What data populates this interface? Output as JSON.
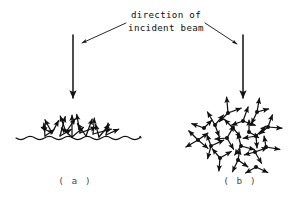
{
  "figure": {
    "background_color": "#ffffff",
    "ink_color": "#111111",
    "label_color": "#4a4a4a",
    "annotation": {
      "line1": "direction of",
      "line2": "incident beam"
    },
    "panels": [
      {
        "id": "a",
        "label": "( a )",
        "kind": "surface-scattering",
        "description": "rough wavy surface with arrows scattering upward"
      },
      {
        "id": "b",
        "label": "( b )",
        "kind": "volume-scattering",
        "description": "cloud of scattering centres with arrows radiating in all directions"
      }
    ],
    "incident_beams": [
      {
        "name": "beam-arrow-a",
        "x": 73,
        "y_top": 35,
        "y_bottom": 98
      },
      {
        "name": "beam-arrow-b",
        "x": 243,
        "y_top": 35,
        "y_bottom": 98
      }
    ],
    "leaders": [
      {
        "name": "leader-left",
        "x1": 126,
        "y1": 23,
        "x2": 82,
        "y2": 43
      },
      {
        "name": "leader-right",
        "x1": 205,
        "y1": 23,
        "x2": 237,
        "y2": 44
      }
    ],
    "wavy_surface": {
      "x_start": 16,
      "x_end": 141,
      "y_center": 138,
      "amplitude": 3.2,
      "wavelength": 9.5
    },
    "surface_rays": [
      {
        "x": 52,
        "y": 133,
        "angle": -118,
        "len": 15
      },
      {
        "x": 52,
        "y": 133,
        "angle": -62,
        "len": 14
      },
      {
        "x": 52,
        "y": 133,
        "angle": -152,
        "len": 12
      },
      {
        "x": 60,
        "y": 136,
        "angle": -75,
        "len": 20
      },
      {
        "x": 60,
        "y": 136,
        "angle": -30,
        "len": 13
      },
      {
        "x": 66,
        "y": 132,
        "angle": -110,
        "len": 17
      },
      {
        "x": 66,
        "y": 132,
        "angle": -55,
        "len": 16
      },
      {
        "x": 72,
        "y": 137,
        "angle": -90,
        "len": 22
      },
      {
        "x": 72,
        "y": 137,
        "angle": -140,
        "len": 14
      },
      {
        "x": 72,
        "y": 137,
        "angle": -40,
        "len": 15
      },
      {
        "x": 80,
        "y": 133,
        "angle": -100,
        "len": 19
      },
      {
        "x": 80,
        "y": 133,
        "angle": -20,
        "len": 17
      },
      {
        "x": 86,
        "y": 136,
        "angle": -70,
        "len": 18
      },
      {
        "x": 86,
        "y": 136,
        "angle": -125,
        "len": 15
      },
      {
        "x": 93,
        "y": 134,
        "angle": -85,
        "len": 16
      },
      {
        "x": 93,
        "y": 134,
        "angle": -15,
        "len": 19
      },
      {
        "x": 99,
        "y": 137,
        "angle": -50,
        "len": 16
      },
      {
        "x": 99,
        "y": 137,
        "angle": -105,
        "len": 13
      },
      {
        "x": 45,
        "y": 136,
        "angle": -95,
        "len": 13
      },
      {
        "x": 45,
        "y": 136,
        "angle": -35,
        "len": 11
      },
      {
        "x": 106,
        "y": 135,
        "angle": -25,
        "len": 14
      },
      {
        "x": 106,
        "y": 135,
        "angle": -80,
        "len": 12
      }
    ],
    "volume_nodes": [
      {
        "x": 198,
        "y": 140,
        "rays": [
          {
            "angle": 150,
            "len": 14
          },
          {
            "angle": -135,
            "len": 13
          },
          {
            "angle": -35,
            "len": 12
          },
          {
            "angle": 40,
            "len": 13
          }
        ]
      },
      {
        "x": 215,
        "y": 125,
        "rays": [
          {
            "angle": -120,
            "len": 15
          },
          {
            "angle": -50,
            "len": 13
          },
          {
            "angle": 70,
            "len": 12
          }
        ]
      },
      {
        "x": 228,
        "y": 113,
        "rays": [
          {
            "angle": -95,
            "len": 16
          },
          {
            "angle": -20,
            "len": 14
          },
          {
            "angle": 135,
            "len": 12
          }
        ]
      },
      {
        "x": 243,
        "y": 121,
        "rays": [
          {
            "angle": -70,
            "len": 15
          },
          {
            "angle": 20,
            "len": 13
          },
          {
            "angle": 160,
            "len": 12
          }
        ]
      },
      {
        "x": 257,
        "y": 112,
        "rays": [
          {
            "angle": -80,
            "len": 14
          },
          {
            "angle": -15,
            "len": 12
          },
          {
            "angle": 115,
            "len": 13
          }
        ]
      },
      {
        "x": 211,
        "y": 146,
        "rays": [
          {
            "angle": 105,
            "len": 13
          },
          {
            "angle": -110,
            "len": 12
          },
          {
            "angle": -25,
            "len": 14
          }
        ]
      },
      {
        "x": 227,
        "y": 138,
        "rays": [
          {
            "angle": -60,
            "len": 14
          },
          {
            "angle": 60,
            "len": 13
          },
          {
            "angle": 175,
            "len": 12
          }
        ]
      },
      {
        "x": 241,
        "y": 146,
        "rays": [
          {
            "angle": -105,
            "len": 13
          },
          {
            "angle": 15,
            "len": 14
          },
          {
            "angle": 125,
            "len": 11
          }
        ]
      },
      {
        "x": 256,
        "y": 136,
        "rays": [
          {
            "angle": -45,
            "len": 14
          },
          {
            "angle": 85,
            "len": 12
          },
          {
            "angle": 170,
            "len": 13
          }
        ]
      },
      {
        "x": 268,
        "y": 127,
        "rays": [
          {
            "angle": -70,
            "len": 13
          },
          {
            "angle": 5,
            "len": 14
          },
          {
            "angle": 140,
            "len": 11
          }
        ]
      },
      {
        "x": 220,
        "y": 158,
        "rays": [
          {
            "angle": 95,
            "len": 13
          },
          {
            "angle": -130,
            "len": 12
          },
          {
            "angle": -30,
            "len": 13
          }
        ]
      },
      {
        "x": 238,
        "y": 160,
        "rays": [
          {
            "angle": 115,
            "len": 13
          },
          {
            "angle": 35,
            "len": 12
          },
          {
            "angle": -80,
            "len": 11
          }
        ]
      },
      {
        "x": 255,
        "y": 152,
        "rays": [
          {
            "angle": 60,
            "len": 13
          },
          {
            "angle": -20,
            "len": 13
          },
          {
            "angle": 165,
            "len": 11
          }
        ]
      },
      {
        "x": 266,
        "y": 147,
        "rays": [
          {
            "angle": 10,
            "len": 14
          },
          {
            "angle": -100,
            "len": 11
          }
        ]
      },
      {
        "x": 256,
        "y": 167,
        "rays": [
          {
            "angle": 25,
            "len": 13
          },
          {
            "angle": 150,
            "len": 12
          }
        ]
      },
      {
        "x": 204,
        "y": 128,
        "rays": [
          {
            "angle": -160,
            "len": 13
          },
          {
            "angle": -45,
            "len": 11
          }
        ]
      },
      {
        "x": 233,
        "y": 128,
        "rays": [
          {
            "angle": -135,
            "len": 12
          },
          {
            "angle": 50,
            "len": 12
          }
        ]
      },
      {
        "x": 249,
        "y": 132,
        "rays": [
          {
            "angle": -90,
            "len": 12
          },
          {
            "angle": 30,
            "len": 11
          }
        ]
      }
    ],
    "caption_positions": {
      "text_line1_x": 166,
      "text_line1_y": 18,
      "text_line2_x": 166,
      "text_line2_y": 31,
      "label_a_x": 75,
      "label_a_y": 184,
      "label_b_x": 240,
      "label_b_y": 184
    }
  }
}
